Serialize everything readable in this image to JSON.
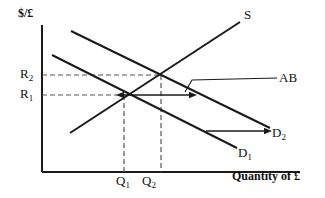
{
  "figure": {
    "axes": {
      "y_label": "$/£",
      "x_label": "Quantity of £",
      "origin": [
        42,
        172
      ],
      "y_top": 25,
      "x_right": 300
    },
    "tick_labels": {
      "y": [
        {
          "name": "R2",
          "text": "R",
          "sub": "2",
          "value_y": 75
        },
        {
          "name": "R1",
          "text": "R",
          "sub": "1",
          "value_y": 95
        }
      ],
      "x": [
        {
          "name": "Q1",
          "text": "Q",
          "sub": "1",
          "value_x": 122
        },
        {
          "name": "Q2",
          "text": "Q",
          "sub": "2",
          "value_x": 148
        }
      ]
    },
    "curves": [
      {
        "name": "supply-curve",
        "label": "S",
        "label_sub": "",
        "from": [
          70,
          133
        ],
        "to": [
          240,
          22
        ],
        "slope": "upward",
        "color": "#1a1a1a"
      },
      {
        "name": "demand-curve-1",
        "label": "D",
        "label_sub": "1",
        "from": [
          52,
          55
        ],
        "to": [
          237,
          148
        ],
        "slope": "downward",
        "color": "#1a1a1a"
      },
      {
        "name": "demand-curve-2",
        "label": "D",
        "label_sub": "2",
        "from": [
          71,
          31
        ],
        "to": [
          270,
          128
        ],
        "slope": "downward",
        "color": "#1a1a1a"
      }
    ],
    "annotations": [
      {
        "name": "ab-callout",
        "label": "AB",
        "leader_from": [
          185,
          92
        ],
        "leader_to": [
          277,
          78
        ]
      },
      {
        "name": "shift-arrow-horizontal",
        "from": [
          190,
          95
        ],
        "to": [
          124,
          95
        ],
        "double_headed": true
      },
      {
        "name": "shift-arrow-demand",
        "from": [
          206,
          131
        ],
        "to": [
          265,
          131
        ],
        "double_headed": false
      }
    ],
    "equilibria": [
      {
        "name": "equilibrium-1",
        "x": 124,
        "y": 95
      },
      {
        "name": "equilibrium-2",
        "x": 161,
        "y": 75
      }
    ],
    "guide_lines": {
      "color": "#555555",
      "style": "dashed"
    }
  }
}
